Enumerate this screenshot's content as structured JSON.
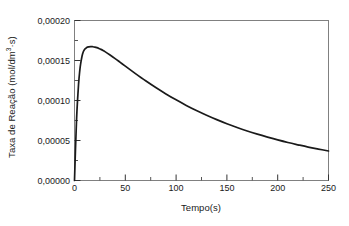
{
  "chart_data": {
    "type": "line",
    "title": "",
    "xlabel": "Tempo(s)",
    "ylabel_text": "Taxa de Reação (mol/dm",
    "ylabel_sup": "3",
    "ylabel_tail": "·s)",
    "ylabel_full": "Taxa de Reação (mol/dm3·s)",
    "xlim": [
      0,
      250
    ],
    "ylim": [
      0,
      0.0002
    ],
    "grid": false,
    "legend": null,
    "line_color": "#1a1a1a",
    "frame_color": "#808080",
    "xticks": [
      0,
      50,
      100,
      150,
      200,
      250
    ],
    "xtick_labels": [
      "0",
      "50",
      "100",
      "150",
      "200",
      "250"
    ],
    "xminor_ticks": [
      25,
      75,
      125,
      175,
      225
    ],
    "yticks": [
      0,
      5e-05,
      0.0001,
      0.00015,
      0.0002
    ],
    "ytick_labels": [
      "0,00000",
      "0,00005",
      "0,00010",
      "0,00015",
      "0,00020"
    ],
    "yminor_ticks": [
      2.5e-05,
      7.5e-05,
      0.000125,
      0.000175
    ],
    "x": [
      0,
      1,
      2,
      3,
      4,
      5,
      6,
      8,
      10,
      12,
      14,
      16,
      18,
      20,
      22,
      24,
      26,
      28,
      30,
      35,
      40,
      45,
      50,
      60,
      70,
      80,
      90,
      100,
      110,
      120,
      130,
      140,
      150,
      160,
      170,
      180,
      190,
      200,
      210,
      220,
      230,
      240,
      250
    ],
    "y": [
      0.0,
      4.05e-05,
      7.55e-05,
      0.0001005,
      0.0001205,
      0.000135,
      0.0001455,
      0.0001585,
      0.000164,
      0.0001662,
      0.0001671,
      0.0001674,
      0.0001672,
      0.0001668,
      0.0001661,
      0.0001651,
      0.0001639,
      0.0001626,
      0.0001611,
      0.0001569,
      0.0001524,
      0.0001477,
      0.000143,
      0.0001336,
      0.0001246,
      0.0001162,
      0.0001082,
      0.0001008,
      9.39e-05,
      8.75e-05,
      8.16e-05,
      7.61e-05,
      7.1e-05,
      6.63e-05,
      6.19e-05,
      5.79e-05,
      5.42e-05,
      5.07e-05,
      4.75e-05,
      4.46e-05,
      4.18e-05,
      3.93e-05,
      3.69e-05
    ],
    "peak": {
      "x": 16,
      "y": 0.0001674
    }
  }
}
